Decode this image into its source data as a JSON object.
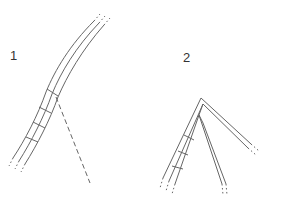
{
  "figures": [
    {
      "label": "1",
      "description": "single curved strand of three parallel lines with cross-rungs and a dashed diverging line"
    },
    {
      "label": "2",
      "description": "branched strand splitting into two arms at an apex, with cross-rungs"
    }
  ],
  "colors": {
    "line": "#666666",
    "label": "#333333",
    "background": "#ffffff"
  }
}
